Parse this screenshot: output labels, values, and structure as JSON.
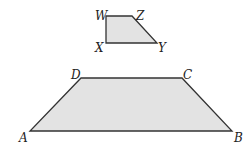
{
  "figure": {
    "small_trapezoid": {
      "fill": "#e3e3e3",
      "stroke": "#333333",
      "vertices": [
        {
          "label": "W",
          "x": 106,
          "y": 16,
          "lx": 95,
          "ly": 20
        },
        {
          "label": "Z",
          "x": 132,
          "y": 16,
          "lx": 136,
          "ly": 20
        },
        {
          "label": "Y",
          "x": 157,
          "y": 43,
          "lx": 158,
          "ly": 52
        },
        {
          "label": "X",
          "x": 106,
          "y": 43,
          "lx": 95,
          "ly": 52
        }
      ]
    },
    "large_trapezoid": {
      "fill": "#e3e3e3",
      "stroke": "#333333",
      "vertices": [
        {
          "label": "D",
          "x": 81,
          "y": 78,
          "lx": 71,
          "ly": 79
        },
        {
          "label": "C",
          "x": 182,
          "y": 78,
          "lx": 183,
          "ly": 79
        },
        {
          "label": "B",
          "x": 232,
          "y": 131,
          "lx": 234,
          "ly": 142
        },
        {
          "label": "A",
          "x": 30,
          "y": 131,
          "lx": 19,
          "ly": 142
        }
      ]
    }
  }
}
